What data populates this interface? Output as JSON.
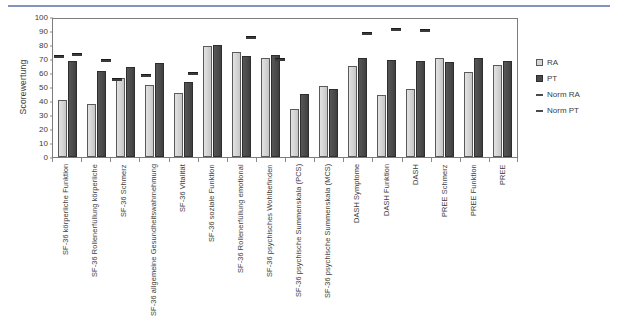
{
  "figure": {
    "ylabel": "Scorewertung"
  },
  "legend": {
    "items": [
      {
        "label": "RA",
        "key": "square-light"
      },
      {
        "label": "PT",
        "key": "square-dark"
      },
      {
        "label": "Norm RA",
        "key": "dash-line"
      },
      {
        "label": "Norm PT",
        "key": "dash-line"
      }
    ]
  },
  "chart_data": {
    "type": "bar",
    "title": "",
    "xlabel": "",
    "ylabel": "Scorewertung",
    "ylim": [
      0,
      100
    ],
    "yticks": [
      0,
      10,
      20,
      30,
      40,
      50,
      60,
      70,
      80,
      90,
      100
    ],
    "grid": false,
    "legend_position": "right",
    "categories": [
      "SF-36 körperliche Funktion",
      "SF-36 Rollenerfüllung körperliche",
      "SF-36 Schmerz",
      "SF-36 allgemeine Gesundheitswahrnehmung",
      "SF-36 Vitalität",
      "SF-36 soziale Funktion",
      "SF-36 Rollenerfüllung emotional",
      "SF-36 psychisches Wohlbefinden",
      "SF-36 psychische Summenskala (PCS)",
      "SF-36 psychische Summenskala (MCS)",
      "DASH Symptome",
      "DASH Funktion",
      "DASH",
      "PREE Schmerz",
      "PREE Funktion",
      "PREE"
    ],
    "series": [
      {
        "name": "RA",
        "values": [
          41.5,
          38.5,
          57.0,
          52.5,
          46.5,
          80.5,
          76.0,
          71.5,
          34.5,
          51.5,
          66.0,
          45.0,
          49.5,
          71.5,
          61.5,
          66.5
        ]
      },
      {
        "name": "PT",
        "values": [
          69.5,
          62.5,
          65.0,
          68.0,
          54.0,
          81.5,
          73.0,
          74.0,
          45.5,
          49.5,
          71.5,
          70.5,
          69.5,
          69.0,
          72.0,
          69.5
        ]
      },
      {
        "name": "Norm RA",
        "values": [
          71.0,
          null,
          54.5,
          57.5,
          null,
          null,
          null,
          null,
          null,
          null,
          null,
          null,
          null,
          null,
          null,
          null
        ]
      },
      {
        "name": "Norm PT",
        "values": [
          72.5,
          68.0,
          null,
          null,
          58.5,
          null,
          84.0,
          68.5,
          null,
          null,
          87.5,
          90.0,
          89.5,
          null,
          null,
          null
        ]
      }
    ]
  }
}
